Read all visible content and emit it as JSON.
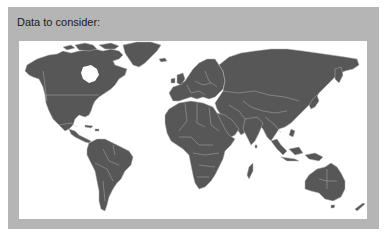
{
  "panel": {
    "title": "Data to consider:"
  },
  "map": {
    "type": "world-map",
    "description": "Political world map with country borders, dark gray land on white background",
    "colors": {
      "panel_background": "#b5b5b5",
      "map_background": "#ffffff",
      "land_fill": "#575757",
      "border_stroke": "#b0b0b0"
    },
    "regions": [
      "North America",
      "Greenland",
      "Central America",
      "South America",
      "Europe",
      "Africa",
      "Middle East",
      "Russia",
      "Asia",
      "Southeast Asia",
      "Australia",
      "New Zealand"
    ]
  }
}
